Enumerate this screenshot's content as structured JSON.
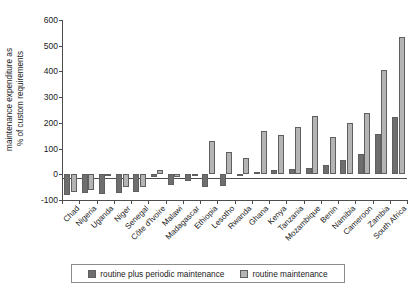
{
  "chart_data": {
    "type": "bar",
    "title": "",
    "xlabel": "",
    "ylabel": "maintenance expenditure as % of custom requirements",
    "ylabel_lines": [
      "maintenance expenditure as",
      "% of custom requirements"
    ],
    "ylim": [
      -100,
      600
    ],
    "yticks": [
      -100,
      0,
      100,
      200,
      300,
      400,
      500,
      600
    ],
    "ytick_labels": [
      "-100",
      "0",
      "100",
      "200",
      "300",
      "400",
      "500",
      "600"
    ],
    "grid": false,
    "legend_position": "bottom",
    "categories": [
      "Chad",
      "Nigeria",
      "Uganda",
      "Niger",
      "Senegal",
      "Côte d'Ivoire",
      "Malawi",
      "Madagascar",
      "Ethiopia",
      "Lesotho",
      "Rwanda",
      "Ghana",
      "Kenya",
      "Tanzania",
      "Mozambique",
      "Benin",
      "Namibia",
      "Cameroon",
      "Zambia",
      "South Africa"
    ],
    "series": [
      {
        "name": "routine plus periodic maintenance",
        "color": "#6e6e6e",
        "values": [
          -80,
          -72,
          -75,
          -72,
          -70,
          -12,
          -42,
          -28,
          -50,
          -45,
          -8,
          10,
          18,
          22,
          25,
          35,
          55,
          78,
          155,
          222
        ]
      },
      {
        "name": "routine maintenance",
        "color": "#b4b4b4",
        "values": [
          -68,
          -60,
          -8,
          -50,
          -48,
          18,
          -10,
          -8,
          128,
          85,
          62,
          170,
          152,
          185,
          225,
          145,
          200,
          240,
          405,
          535
        ]
      }
    ]
  },
  "legend": {
    "entries": [
      {
        "label": "routine plus periodic maintenance",
        "swatch": "dark"
      },
      {
        "label": "routine maintenance",
        "swatch": "light"
      }
    ]
  }
}
